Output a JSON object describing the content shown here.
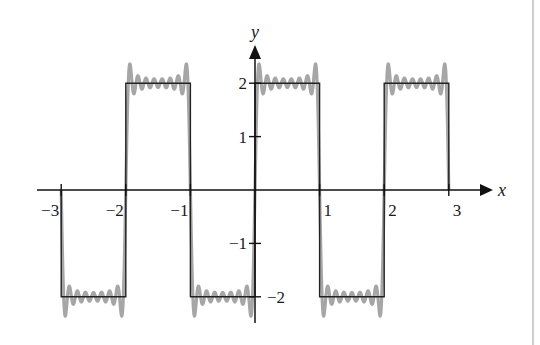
{
  "chart_data": {
    "type": "line",
    "title": "",
    "xlabel": "x",
    "ylabel": "y",
    "xlim": [
      -3,
      3
    ],
    "ylim": [
      -2,
      2
    ],
    "grid": false,
    "legend": null,
    "x_ticks": [
      -3,
      -2,
      -1,
      1,
      2,
      3
    ],
    "x_tick_labels": [
      "−3",
      "−2",
      "−1",
      "1",
      "2",
      "3"
    ],
    "y_ticks": [
      2,
      1,
      -1,
      -2
    ],
    "y_tick_labels": [
      "2",
      "1",
      "−1",
      "−2"
    ],
    "series": [
      {
        "name": "square wave",
        "kind": "square",
        "amplitude": 2,
        "period": 2,
        "description": "f(x) = 2 for 0<x<1, -2 for -1<x<0, periodic with period 2",
        "color": "#222222",
        "points": [
          [
            -3,
            0
          ],
          [
            -3,
            -2
          ],
          [
            -2,
            -2
          ],
          [
            -2,
            2
          ],
          [
            -1,
            2
          ],
          [
            -1,
            -2
          ],
          [
            0,
            -2
          ],
          [
            0,
            2
          ],
          [
            1,
            2
          ],
          [
            1,
            -2
          ],
          [
            2,
            -2
          ],
          [
            2,
            2
          ],
          [
            3,
            2
          ],
          [
            3,
            0
          ]
        ]
      },
      {
        "name": "Fourier partial sum",
        "kind": "fourier",
        "amplitude": 2,
        "period": 2,
        "odd_harmonics": 8,
        "max_harmonic": 15,
        "description": "(8/pi) * sum_{k=1..8} sin((2k-1) pi x)/(2k-1)",
        "color": "#a6a6a6"
      }
    ]
  },
  "axes": {
    "x_name": "x",
    "y_name": "y"
  }
}
